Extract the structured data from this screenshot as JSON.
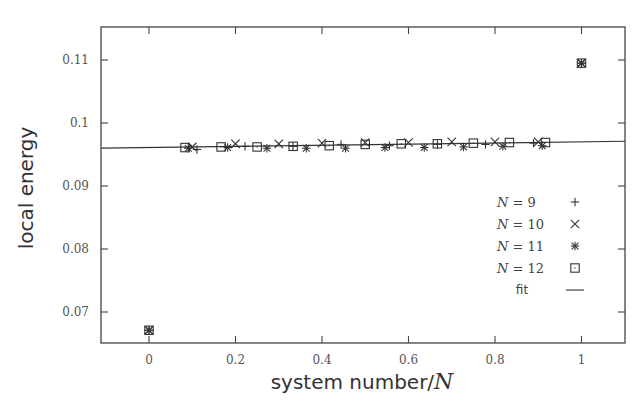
{
  "chart_data": {
    "type": "scatter",
    "title": "",
    "xlabel": "system number/N",
    "ylabel": "local energy",
    "xlim": [
      -0.11,
      1.1
    ],
    "ylim": [
      0.065,
      0.1145
    ],
    "xticks": [
      0,
      0.2,
      0.4,
      0.6,
      0.8,
      1
    ],
    "xtick_labels": [
      "0",
      "0.2",
      "0.4",
      "0.6",
      "0.8",
      "1"
    ],
    "yticks": [
      0.07,
      0.08,
      0.09,
      0.1,
      0.11
    ],
    "ytick_labels": [
      "0.07",
      "0.08",
      "0.09",
      "0.1",
      "0.11"
    ],
    "grid": false,
    "legend_position": "lower right",
    "series": [
      {
        "name": "N = 9",
        "marker": "plus",
        "x": [
          0,
          0.111,
          0.222,
          0.333,
          0.444,
          0.556,
          0.667,
          0.778,
          0.889,
          1
        ],
        "y": [
          0.0671,
          0.0958,
          0.0963,
          0.0963,
          0.0966,
          0.0964,
          0.0966,
          0.0966,
          0.0968,
          0.1095
        ]
      },
      {
        "name": "N = 10",
        "marker": "x",
        "x": [
          0,
          0.1,
          0.2,
          0.3,
          0.4,
          0.5,
          0.6,
          0.7,
          0.8,
          0.9,
          1
        ],
        "y": [
          0.0671,
          0.0962,
          0.0967,
          0.0967,
          0.0968,
          0.0969,
          0.0969,
          0.097,
          0.097,
          0.097,
          0.1095
        ]
      },
      {
        "name": "N = 11",
        "marker": "asterisk",
        "x": [
          0,
          0.0909,
          0.1818,
          0.2727,
          0.3636,
          0.4545,
          0.5455,
          0.6364,
          0.7273,
          0.8182,
          0.9091,
          1
        ],
        "y": [
          0.0671,
          0.096,
          0.0961,
          0.096,
          0.096,
          0.096,
          0.0961,
          0.0961,
          0.0962,
          0.0963,
          0.0964,
          0.1095
        ]
      },
      {
        "name": "N = 12",
        "marker": "square",
        "x": [
          0,
          0.0833,
          0.1667,
          0.25,
          0.3333,
          0.4167,
          0.5,
          0.5833,
          0.6667,
          0.75,
          0.8333,
          0.9167,
          1
        ],
        "y": [
          0.0671,
          0.0961,
          0.0962,
          0.0962,
          0.0963,
          0.0964,
          0.0966,
          0.0967,
          0.0967,
          0.0968,
          0.0969,
          0.0969,
          0.1095
        ]
      },
      {
        "name": "fit",
        "marker": "line",
        "x": [
          -0.11,
          1.1
        ],
        "y": [
          0.096,
          0.0971
        ]
      }
    ]
  },
  "legend": {
    "items": [
      {
        "label": "N = 9",
        "n": "9",
        "marker": "plus"
      },
      {
        "label": "N = 10",
        "n": "10",
        "marker": "x"
      },
      {
        "label": "N = 11",
        "n": "11",
        "marker": "asterisk"
      },
      {
        "label": "N = 12",
        "n": "12",
        "marker": "square"
      },
      {
        "label": "fit",
        "marker": "line"
      }
    ]
  },
  "axes": {
    "xlabel_text": "system number/",
    "xlabel_var": "N",
    "ylabel_text": "local energy"
  },
  "colors": {
    "axis": "#444444",
    "marker": "#333333",
    "text": "#555555"
  }
}
